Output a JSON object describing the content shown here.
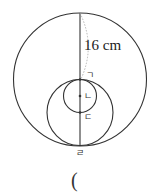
{
  "diagram": {
    "measure_label": "16 cm",
    "points": {
      "top_tangent": "ㄱ",
      "small_center": "ㄴ",
      "small_bottom": "ㄷ",
      "bottom": "ㄹ"
    },
    "answer_paren": "("
  }
}
